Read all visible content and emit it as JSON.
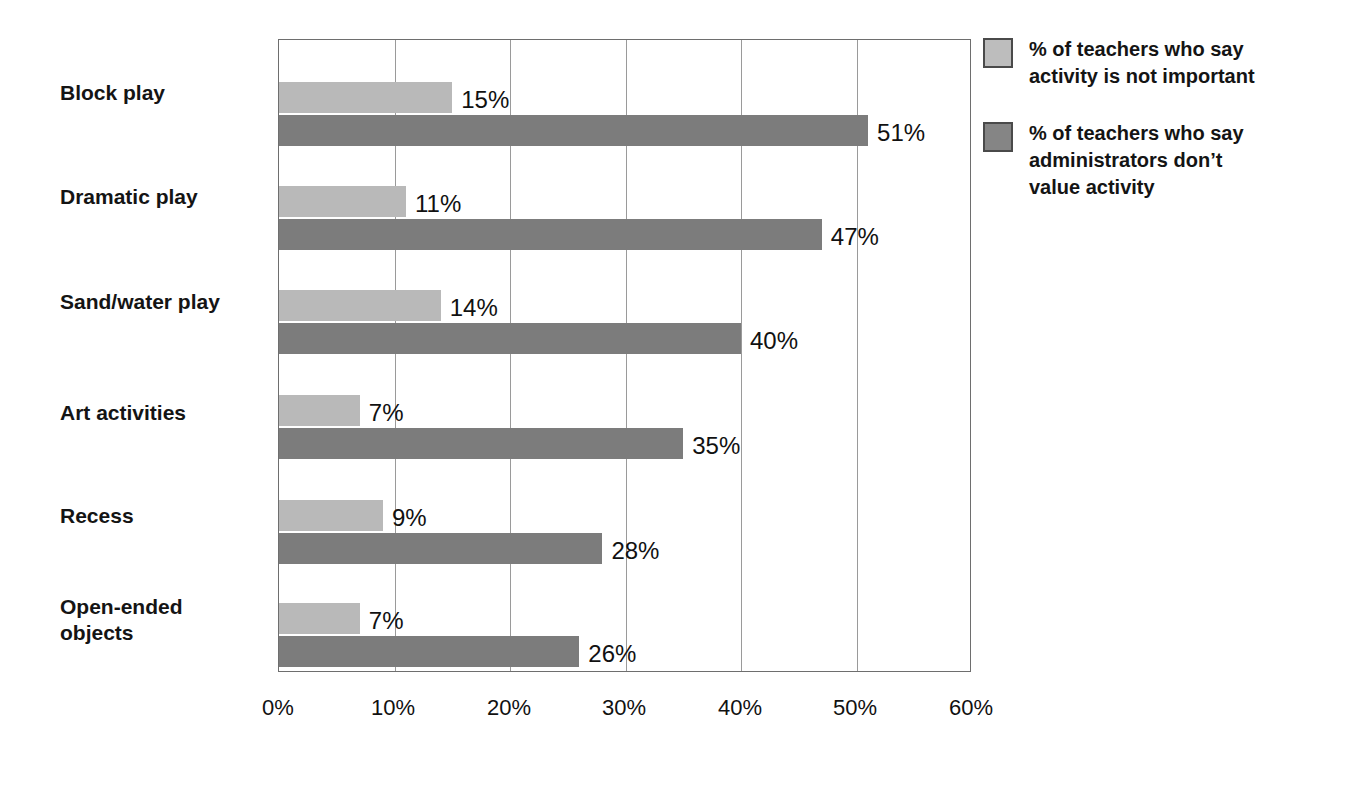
{
  "chart_data": {
    "type": "bar",
    "orientation": "horizontal",
    "title": "",
    "xlabel": "",
    "ylabel": "",
    "xlim": [
      0,
      60
    ],
    "xticks": [
      "0%",
      "10%",
      "20%",
      "30%",
      "40%",
      "50%",
      "60%"
    ],
    "xtick_values": [
      0,
      10,
      20,
      30,
      40,
      50,
      60
    ],
    "grid": "vertical",
    "legend_position": "right",
    "categories": [
      "Block play",
      "Dramatic play",
      "Sand/water play",
      "Art activities",
      "Recess",
      "Open-ended\nobjects"
    ],
    "series": [
      {
        "name": "% of teachers who say\nactivity is not important",
        "color": "#b9b9b9",
        "values": [
          15,
          11,
          14,
          7,
          9,
          7
        ],
        "labels": [
          "15%",
          "11%",
          "14%",
          "7%",
          "9%",
          "7%"
        ]
      },
      {
        "name": "% of teachers who say\nadministrators don’t\nvalue activity",
        "color": "#7c7c7c",
        "values": [
          51,
          47,
          40,
          35,
          28,
          26
        ],
        "labels": [
          "51%",
          "47%",
          "40%",
          "35%",
          "28%",
          "26%"
        ]
      }
    ]
  },
  "legend": {
    "items": [
      {
        "label": "% of teachers who say\nactivity is not important",
        "swatch": "light"
      },
      {
        "label": "% of teachers who say\nadministrators don’t\nvalue activity",
        "swatch": "dark"
      }
    ]
  },
  "colors": {
    "series_light": "#b9b9b9",
    "series_dark": "#7c7c7c",
    "axis": "#6e6e6e",
    "gridline": "#9a9a9a",
    "text": "#111111"
  }
}
